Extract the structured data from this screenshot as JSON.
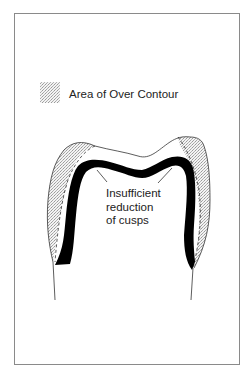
{
  "figure": {
    "type": "dental cross-section diagram",
    "legend": {
      "swatch": "stippled-pattern",
      "label": "Area of Over Contour"
    },
    "annotation": {
      "lines": [
        "Insufficient",
        "reduction",
        "of cusps"
      ]
    },
    "colors": {
      "background": "#ffffff",
      "frame": "#8a8a8a",
      "coping": "#000000",
      "outline": "#333333",
      "stipple": "#bdbdbd",
      "text": "#222222"
    }
  }
}
